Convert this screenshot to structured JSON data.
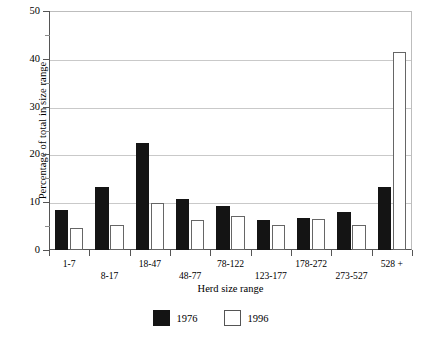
{
  "chart_data": {
    "type": "bar",
    "title": "",
    "subtitle": "",
    "xlabel": "Herd size range",
    "ylabel": "Percentage of total in size range",
    "categories": [
      "1-7",
      "8-17",
      "18-47",
      "48-77",
      "78-122",
      "123-177",
      "178-272",
      "273-527",
      "528 +"
    ],
    "series": [
      {
        "name": "1976",
        "color": "#141414",
        "values": [
          8.3,
          13.2,
          22.4,
          10.6,
          9.2,
          6.3,
          6.8,
          8.0,
          13.2
        ]
      },
      {
        "name": "1996",
        "color": "#ffffff",
        "values": [
          4.6,
          5.3,
          9.8,
          6.2,
          7.2,
          5.2,
          6.4,
          5.2,
          41.5
        ]
      }
    ],
    "ylim": [
      0,
      50
    ],
    "ytick_labels": [
      "0",
      "10",
      "20",
      "30",
      "40",
      "50"
    ],
    "ytick_values": [
      0,
      10,
      20,
      30,
      40,
      50
    ],
    "yminor_values": [
      5,
      15,
      25,
      35,
      45
    ],
    "grid": "horizontal",
    "legend_position": "bottom-center",
    "legend_entries": [
      "1976",
      "1996"
    ]
  }
}
